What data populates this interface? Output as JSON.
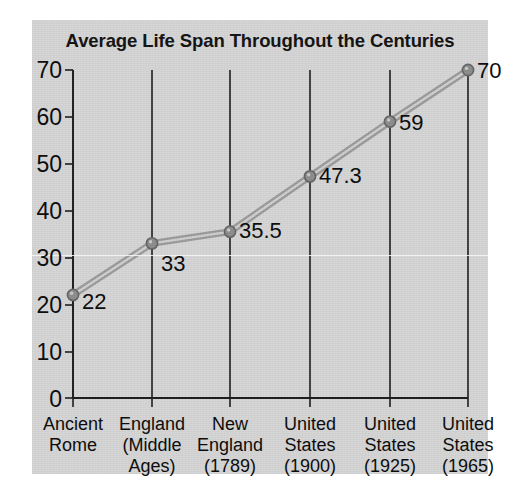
{
  "panel": {
    "background_color": "#d5d5d5",
    "page_background_color": "#ffffff"
  },
  "chart_data": {
    "type": "line",
    "title": "Average Life Span Throughout the Centuries",
    "xlabel": "",
    "ylabel": "",
    "ylim": [
      0,
      70
    ],
    "yticks": [
      0,
      10,
      20,
      30,
      40,
      50,
      60,
      70
    ],
    "ytick_labels": [
      "0",
      "10",
      "20",
      "30",
      "40",
      "50",
      "60",
      "70"
    ],
    "grid": "vertical-category-lines",
    "legend": "none",
    "categories": [
      "Ancient\nRome",
      "England\n(Middle\nAges)",
      "New\nEngland\n(1789)",
      "United\nStates\n(1900)",
      "United\nStates\n(1925)",
      "United\nStates\n(1965)"
    ],
    "values": [
      22,
      33,
      35.5,
      47.3,
      59,
      70
    ],
    "point_labels": [
      "22",
      "33",
      "35.5",
      "47.3",
      "59",
      "70"
    ],
    "series_color": "#9a9a9a",
    "marker_color": "#8c8c8c",
    "axis_color": "#1b1b1b"
  }
}
